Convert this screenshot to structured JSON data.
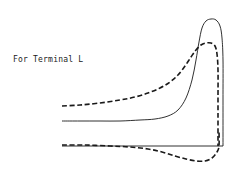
{
  "figure": {
    "label": "For Terminal L",
    "background_color": "#ffffff",
    "stroke_color": "#1a1a1a"
  },
  "chart_data": {
    "type": "line",
    "title": "",
    "subtitle": "",
    "xlabel": "",
    "ylabel": "",
    "annotations": [
      "For Terminal L"
    ],
    "grid": false,
    "legend": null,
    "axis_visible": false,
    "xlim": [
      0,
      247
    ],
    "ylim": [
      176,
      0
    ],
    "baseline": {
      "name": "zero-axis",
      "style": "solid",
      "y": 146,
      "x_start": 62,
      "x_end": 223
    },
    "series": [
      {
        "name": "solid-upper-curve",
        "style": "solid",
        "points": [
          [
            62,
            121
          ],
          [
            80,
            121
          ],
          [
            100,
            121
          ],
          [
            120,
            121
          ],
          [
            140,
            120
          ],
          [
            155,
            119
          ],
          [
            168,
            116
          ],
          [
            178,
            110
          ],
          [
            186,
            98
          ],
          [
            192,
            80
          ],
          [
            196,
            60
          ],
          [
            199,
            42
          ],
          [
            202,
            28
          ],
          [
            206,
            21
          ],
          [
            211,
            19
          ],
          [
            216,
            20
          ],
          [
            220,
            26
          ],
          [
            222,
            38
          ],
          [
            223,
            60
          ],
          [
            223,
            100
          ],
          [
            223,
            146
          ]
        ]
      },
      {
        "name": "dashed-upper-curve",
        "style": "dashed",
        "points": [
          [
            62,
            106
          ],
          [
            80,
            105
          ],
          [
            100,
            103
          ],
          [
            120,
            100
          ],
          [
            135,
            97
          ],
          [
            148,
            93
          ],
          [
            160,
            88
          ],
          [
            170,
            82
          ],
          [
            178,
            75
          ],
          [
            185,
            66
          ],
          [
            191,
            57
          ],
          [
            196,
            50
          ],
          [
            201,
            45
          ],
          [
            206,
            43
          ],
          [
            211,
            43
          ],
          [
            215,
            46
          ],
          [
            217,
            54
          ],
          [
            218,
            70
          ],
          [
            218,
            100
          ],
          [
            218,
            146
          ]
        ]
      },
      {
        "name": "dashed-lower-curve",
        "style": "dashed",
        "points": [
          [
            62,
            145
          ],
          [
            85,
            145
          ],
          [
            110,
            146
          ],
          [
            130,
            147
          ],
          [
            148,
            149
          ],
          [
            162,
            152
          ],
          [
            175,
            156
          ],
          [
            186,
            159
          ],
          [
            196,
            161
          ],
          [
            205,
            161
          ],
          [
            212,
            158
          ],
          [
            217,
            152
          ],
          [
            219,
            146
          ],
          [
            219,
            130
          ]
        ]
      }
    ]
  }
}
